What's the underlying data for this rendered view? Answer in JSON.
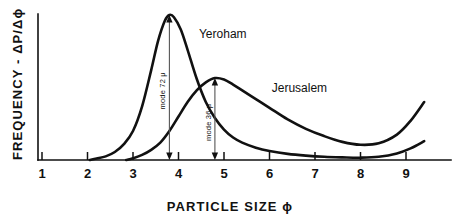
{
  "chart_data": {
    "type": "line",
    "title": "",
    "xlabel": "PARTICLE SIZE ϕ",
    "ylabel": "FREQUENCY - ΔP/Δϕ",
    "xlim": [
      1,
      9.5
    ],
    "ylim": [
      0,
      1
    ],
    "xticks": [
      1,
      2,
      3,
      4,
      5,
      6,
      7,
      8,
      9
    ],
    "xtick_labels": [
      "1",
      "2",
      "3",
      "4",
      "5",
      "6",
      "7",
      "8",
      "9"
    ],
    "yticks": [],
    "ytick_labels": [],
    "grid": false,
    "legend_position": "inline-annotations",
    "series": [
      {
        "name": "Yeroham",
        "label_x": 4.45,
        "label_y": 0.84,
        "mode_phi": 3.8,
        "x": [
          2.05,
          2.2,
          2.4,
          2.6,
          2.8,
          3.0,
          3.2,
          3.4,
          3.55,
          3.7,
          3.8,
          3.9,
          4.05,
          4.2,
          4.4,
          4.6,
          4.8,
          5.0,
          5.2,
          5.4,
          5.7,
          6.0,
          6.4,
          6.8,
          7.2,
          7.6,
          8.0,
          8.4,
          8.8,
          9.1,
          9.4
        ],
        "y": [
          0.0,
          0.01,
          0.025,
          0.055,
          0.11,
          0.2,
          0.37,
          0.62,
          0.82,
          0.96,
          1.0,
          0.985,
          0.9,
          0.76,
          0.56,
          0.4,
          0.29,
          0.21,
          0.155,
          0.12,
          0.085,
          0.062,
          0.042,
          0.03,
          0.022,
          0.018,
          0.016,
          0.022,
          0.045,
          0.08,
          0.13
        ]
      },
      {
        "name": "Jerusalem",
        "label_x": 6.05,
        "label_y": 0.47,
        "mode_phi": 4.8,
        "x": [
          2.85,
          3.0,
          3.2,
          3.4,
          3.6,
          3.8,
          4.0,
          4.2,
          4.4,
          4.6,
          4.8,
          5.0,
          5.2,
          5.4,
          5.7,
          6.0,
          6.4,
          6.8,
          7.2,
          7.6,
          8.0,
          8.4,
          8.8,
          9.1,
          9.4
        ],
        "y": [
          0.0,
          0.012,
          0.035,
          0.07,
          0.12,
          0.2,
          0.3,
          0.4,
          0.48,
          0.535,
          0.565,
          0.555,
          0.52,
          0.48,
          0.42,
          0.36,
          0.28,
          0.215,
          0.165,
          0.125,
          0.105,
          0.115,
          0.175,
          0.27,
          0.4
        ]
      }
    ],
    "annotations": [
      {
        "text": "mode 72 μ",
        "series": "Yeroham",
        "phi": 3.8,
        "top_value": 1.0,
        "bottom_value": 0.0
      },
      {
        "text": "mode 36 μ",
        "series": "Jerusalem",
        "phi": 4.8,
        "top_value": 0.565,
        "bottom_value": 0.0
      }
    ]
  },
  "figure": {
    "axis_color": "#111111",
    "curve_color": "#111111",
    "annotation_color": "#555555",
    "background": "#ffffff"
  }
}
